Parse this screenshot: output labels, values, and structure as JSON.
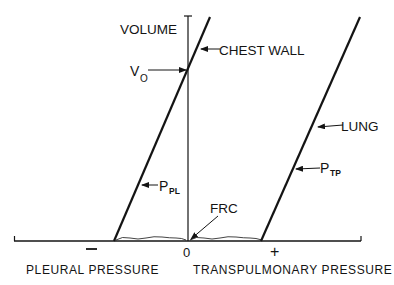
{
  "diagram": {
    "axis_labels": {
      "y": "VOLUME",
      "x_left": "PLEURAL PRESSURE",
      "x_right": "TRANSPULMONARY PRESSURE"
    },
    "ticks": {
      "minus": "−",
      "zero": "0",
      "plus": "+"
    },
    "curves": {
      "chest_wall": "CHEST WALL",
      "lung": "LUNG"
    },
    "annotations": {
      "v0_main": "V",
      "v0_sub": "O",
      "ppl_main": "P",
      "ppl_sub": "PL",
      "ptp_main": "P",
      "ptp_sub": "TP",
      "frc": "FRC"
    },
    "colors": {
      "ink": "#141414",
      "background": "#ffffff"
    }
  }
}
